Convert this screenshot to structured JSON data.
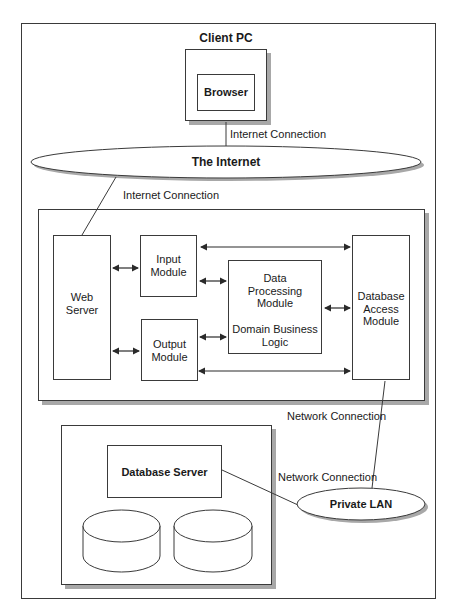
{
  "diagram": {
    "client_pc": {
      "title": "Client PC",
      "browser": "Browser"
    },
    "internet": {
      "label": "The Internet"
    },
    "connections": {
      "client_to_internet": "Internet Connection",
      "internet_to_server": "Internet Connection",
      "server_to_lan": "Network Connection",
      "db_to_lan": "Network Connection"
    },
    "app_server": {
      "web_server": [
        "Web",
        "Server"
      ],
      "input_module": [
        "Input",
        "Module"
      ],
      "output_module": [
        "Output",
        "Module"
      ],
      "data_processing": [
        "Data",
        "Processing",
        "Module"
      ],
      "domain_logic": [
        "Domain Business",
        "Logic"
      ],
      "db_access": [
        "Database",
        "Access",
        "Module"
      ]
    },
    "database": {
      "server": "Database Server",
      "disks": 2
    },
    "private_lan": {
      "label": "Private LAN"
    }
  },
  "colors": {
    "line": "#3a3a3a",
    "shadow": "#a8a8a8",
    "background": "#ffffff"
  }
}
